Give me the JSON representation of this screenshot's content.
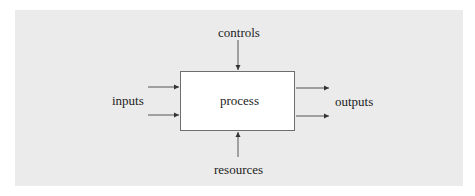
{
  "diagram": {
    "type": "process-block-diagram",
    "center": {
      "label": "process"
    },
    "labels": {
      "top": "controls",
      "left": "inputs",
      "right": "outputs",
      "bottom": "resources"
    },
    "arrows": [
      {
        "from": "controls",
        "to": "process",
        "direction": "down",
        "count": 1
      },
      {
        "from": "inputs",
        "to": "process",
        "direction": "right",
        "count": 2
      },
      {
        "from": "process",
        "to": "outputs",
        "direction": "right",
        "count": 2
      },
      {
        "from": "resources",
        "to": "process",
        "direction": "up",
        "count": 1
      }
    ],
    "colors": {
      "background_panel": "#ebebeb",
      "box_fill": "#ffffff",
      "line": "#555555"
    }
  }
}
